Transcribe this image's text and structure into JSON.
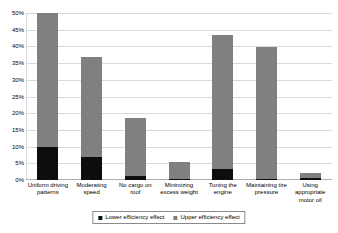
{
  "chart_data": {
    "type": "bar",
    "subtype": "stacked-column",
    "title": "",
    "xlabel": "",
    "ylabel": "",
    "ylim": [
      0,
      50
    ],
    "ytick_step": 5,
    "ytick_labels": [
      "50%",
      "45%",
      "40%",
      "35%",
      "30%",
      "25%",
      "20%",
      "15%",
      "10%",
      "5%",
      "0%"
    ],
    "ytick_values": [
      50,
      45,
      40,
      35,
      30,
      25,
      20,
      15,
      10,
      5,
      0
    ],
    "grid": true,
    "legend_position": "bottom",
    "categories": [
      "Uniform driving patterns",
      "Moderating speed",
      "No cargo on roof",
      "Minimizing excess weight",
      "Tuning the engine",
      "Maintaining tire pressure",
      "Using appropriate motor oil"
    ],
    "series": [
      {
        "name": "Lower efficiency effect",
        "color": "#0d0d0d",
        "values": [
          9.8,
          6.8,
          1.3,
          0.4,
          3.3,
          0.4,
          0.5
        ]
      },
      {
        "name": "Upper efficiency effect",
        "color": "#808080",
        "values": [
          40.2,
          30.0,
          17.2,
          5.0,
          40.0,
          39.4,
          1.7
        ]
      }
    ],
    "totals": [
      50.0,
      36.8,
      18.5,
      5.4,
      43.3,
      39.8,
      2.2
    ]
  },
  "legend": {
    "entries": [
      {
        "label": "Lower efficiency effect",
        "color": "#0d0d0d"
      },
      {
        "label": "Upper efficiency effect",
        "color": "#808080"
      }
    ]
  },
  "colors": {
    "lower": "#0d0d0d",
    "upper": "#808080",
    "grid": "#d9d9d9",
    "background": "#ffffff"
  }
}
